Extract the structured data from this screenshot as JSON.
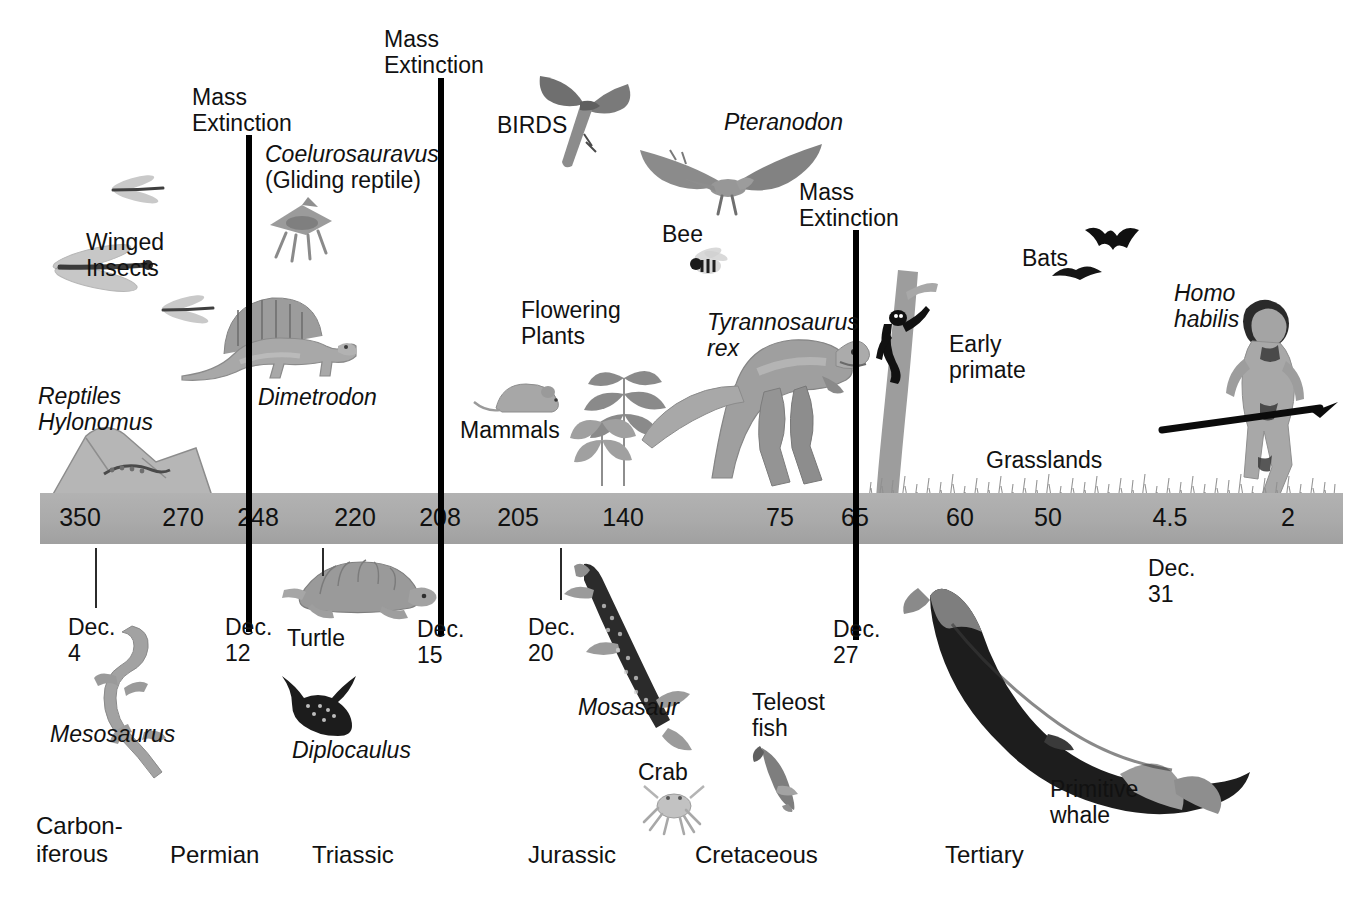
{
  "figure": {
    "type": "geologic-timeline",
    "axis_units": "millions of years ago",
    "bar_color": "#ababab",
    "line_color": "#000000"
  },
  "timeline": {
    "ticks": [
      {
        "value": "350",
        "x": 80
      },
      {
        "value": "270",
        "x": 183
      },
      {
        "value": "248",
        "x": 258
      },
      {
        "value": "220",
        "x": 355
      },
      {
        "value": "208",
        "x": 440
      },
      {
        "value": "205",
        "x": 518
      },
      {
        "value": "140",
        "x": 623
      },
      {
        "value": "75",
        "x": 780
      },
      {
        "value": "65",
        "x": 855
      },
      {
        "value": "60",
        "x": 960
      },
      {
        "value": "50",
        "x": 1048
      },
      {
        "value": "4.5",
        "x": 1170
      },
      {
        "value": "2",
        "x": 1288
      }
    ]
  },
  "mass_extinctions": [
    {
      "label": "Mass\nExtinction",
      "line_x": 249,
      "label_x": 192,
      "label_y": 85,
      "line_top": 135,
      "line_bottom": 632
    },
    {
      "label": "Mass\nExtinction",
      "line_x": 441,
      "label_x": 384,
      "label_y": 27,
      "line_top": 78,
      "line_bottom": 636
    },
    {
      "label": "Mass\nExtinction",
      "line_x": 856,
      "label_x": 799,
      "label_y": 180,
      "line_top": 230,
      "line_bottom": 640
    }
  ],
  "calendar_marks": [
    {
      "label": "Dec.\n4",
      "x": 68,
      "y": 615,
      "tick_x": 95,
      "tick_top": 548,
      "tick_h": 60
    },
    {
      "label": "Dec.\n12",
      "x": 225,
      "y": 615,
      "tick_x": null,
      "tick_top": null,
      "tick_h": null
    },
    {
      "label": "Dec.\n15",
      "x": 417,
      "y": 617,
      "tick_x": null,
      "tick_top": null,
      "tick_h": null
    },
    {
      "label": "Dec.\n20",
      "x": 528,
      "y": 615,
      "tick_x": 560,
      "tick_top": 548,
      "tick_h": 52
    },
    {
      "label": "Dec.\n27",
      "x": 833,
      "y": 617,
      "tick_x": null,
      "tick_top": null,
      "tick_h": null
    },
    {
      "label": "Dec.\n31",
      "x": 1148,
      "y": 556,
      "tick_x": null,
      "tick_top": null,
      "tick_h": null
    }
  ],
  "extra_ticks": [
    {
      "x": 322,
      "top": 548,
      "h": 28
    },
    {
      "x": 1268,
      "top": 548,
      "h": 0
    }
  ],
  "periods": [
    {
      "name": "Carbon-\niferous",
      "x": 36,
      "y": 812
    },
    {
      "name": "Permian",
      "x": 170,
      "y": 841
    },
    {
      "name": "Triassic",
      "x": 312,
      "y": 841
    },
    {
      "name": "Jurassic",
      "x": 528,
      "y": 841
    },
    {
      "name": "Cretaceous",
      "x": 695,
      "y": 841
    },
    {
      "name": "Tertiary",
      "x": 945,
      "y": 841
    }
  ],
  "annotations": [
    {
      "name": "winged-insects",
      "text": "Winged\nInsects",
      "x": 86,
      "y": 230,
      "italic": false
    },
    {
      "name": "reptiles-hylonomus",
      "text": "Reptiles\nHylonomus",
      "x": 38,
      "y": 384,
      "italic": true
    },
    {
      "name": "coelurosauravus",
      "text": "Coelurosauravus\n(Gliding reptile)",
      "x": 265,
      "y": 142,
      "italic": false
    },
    {
      "name": "dimetrodon",
      "text": "Dimetrodon",
      "x": 258,
      "y": 385,
      "italic": true
    },
    {
      "name": "birds",
      "text": "BIRDS",
      "x": 497,
      "y": 113,
      "italic": false
    },
    {
      "name": "pteranodon",
      "text": "Pteranodon",
      "x": 724,
      "y": 110,
      "italic": true
    },
    {
      "name": "bee",
      "text": "Bee",
      "x": 662,
      "y": 222,
      "italic": false
    },
    {
      "name": "flowering-plants",
      "text": "Flowering\nPlants",
      "x": 521,
      "y": 298,
      "italic": false
    },
    {
      "name": "tyrannosaurus-rex",
      "text": "Tyrannosaurus\nrex",
      "x": 707,
      "y": 310,
      "italic": true
    },
    {
      "name": "mammals",
      "text": "Mammals",
      "x": 460,
      "y": 418,
      "italic": false
    },
    {
      "name": "bats",
      "text": "Bats",
      "x": 1022,
      "y": 246,
      "italic": false
    },
    {
      "name": "homo-habilis",
      "text": "Homo\nhabilis",
      "x": 1174,
      "y": 281,
      "italic": true
    },
    {
      "name": "early-primate",
      "text": "Early\nprimate",
      "x": 949,
      "y": 332,
      "italic": false
    },
    {
      "name": "grasslands",
      "text": "Grasslands",
      "x": 986,
      "y": 448,
      "italic": false
    },
    {
      "name": "turtle",
      "text": "Turtle",
      "x": 287,
      "y": 626,
      "italic": false
    },
    {
      "name": "mesosaurus",
      "text": "Mesosaurus",
      "x": 50,
      "y": 722,
      "italic": true
    },
    {
      "name": "diplocaulus",
      "text": "Diplocaulus",
      "x": 292,
      "y": 738,
      "italic": true
    },
    {
      "name": "mosasaur",
      "text": "Mosasaur",
      "x": 578,
      "y": 695,
      "italic": true
    },
    {
      "name": "crab",
      "text": "Crab",
      "x": 638,
      "y": 760,
      "italic": false
    },
    {
      "name": "teleost-fish",
      "text": "Teleost\nfish",
      "x": 752,
      "y": 690,
      "italic": false
    },
    {
      "name": "primitive-whale",
      "text": "Primitive\nwhale",
      "x": 1050,
      "y": 777,
      "italic": false
    }
  ],
  "chart_data": {
    "type": "timeline",
    "xlabel": "Millions of years ago",
    "axis_values": [
      350,
      270,
      248,
      220,
      208,
      205,
      140,
      75,
      65,
      60,
      50,
      4.5,
      2
    ],
    "geologic_periods": [
      "Carboniferous",
      "Permian",
      "Triassic",
      "Jurassic",
      "Cretaceous",
      "Tertiary"
    ],
    "mass_extinction_events_mya": [
      248,
      208,
      65
    ],
    "cosmic_calendar_marks": [
      "Dec. 4",
      "Dec. 12",
      "Dec. 15",
      "Dec. 20",
      "Dec. 27",
      "Dec. 31"
    ],
    "organisms": [
      "Winged Insects",
      "Reptiles Hylonomus",
      "Mesosaurus",
      "Dimetrodon",
      "Diplocaulus",
      "Coelurosauravus (Gliding reptile)",
      "Turtle",
      "Mammals",
      "BIRDS",
      "Flowering Plants",
      "Pteranodon",
      "Bee",
      "Tyrannosaurus rex",
      "Mosasaur",
      "Crab",
      "Teleost fish",
      "Early primate",
      "Bats",
      "Grasslands",
      "Primitive whale",
      "Homo habilis"
    ]
  }
}
